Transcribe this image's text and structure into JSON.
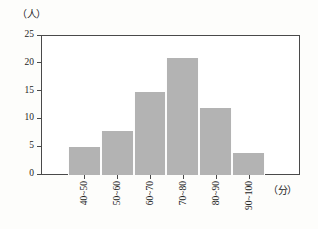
{
  "chart_data": {
    "type": "bar",
    "title": "",
    "subtitle": "",
    "xlabel": "（分）",
    "ylabel": "（人）",
    "categories": [
      "40~50",
      "50~60",
      "60~70",
      "70~80",
      "80~90",
      "90~100"
    ],
    "values": [
      5,
      8,
      15,
      21,
      12,
      4
    ],
    "series": [
      {
        "name": "人数",
        "values": [
          5,
          8,
          15,
          21,
          12,
          4
        ]
      }
    ],
    "ylim": [
      0,
      25
    ],
    "ytick_labels": [
      "0",
      "5",
      "10",
      "15",
      "20",
      "25"
    ],
    "ytick_values": [
      0,
      5,
      10,
      15,
      20,
      25
    ],
    "grid": false,
    "legend": "none",
    "bar_color": "#b3b3b3",
    "axis_color": "#4a4a4a",
    "background_color": "#fdfdfb"
  }
}
